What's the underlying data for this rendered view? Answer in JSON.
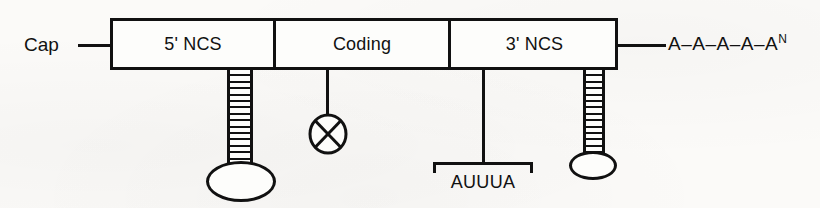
{
  "figure": {
    "type": "mrna-structure-diagram",
    "background_color": "#fbfaf8",
    "ink_color": "#111111"
  },
  "cap": {
    "label": "Cap",
    "connector_name": "cap-connector-line"
  },
  "transcript": {
    "segments": [
      {
        "id": "five-prime-ncs",
        "label": "5' NCS"
      },
      {
        "id": "coding",
        "label": "Coding"
      },
      {
        "id": "three-prime-ncs",
        "label": "3' NCS"
      }
    ]
  },
  "poly_a_tail": {
    "text": "A–A–A–A–A",
    "superscript": "N",
    "connector_name": "poly-a-connector-line"
  },
  "features": [
    {
      "id": "stem-loop-5utr",
      "kind": "stem-loop",
      "attached_to": "5' NCS",
      "rungs": 15
    },
    {
      "id": "x-circle-coding",
      "kind": "circled-x",
      "attached_to": "Coding"
    },
    {
      "id": "auuua-element",
      "kind": "bracketed-sequence",
      "attached_to": "3' NCS",
      "label": "AUUUA"
    },
    {
      "id": "stem-loop-3utr",
      "kind": "stem-loop",
      "attached_to": "3' NCS",
      "rungs": 13
    }
  ]
}
